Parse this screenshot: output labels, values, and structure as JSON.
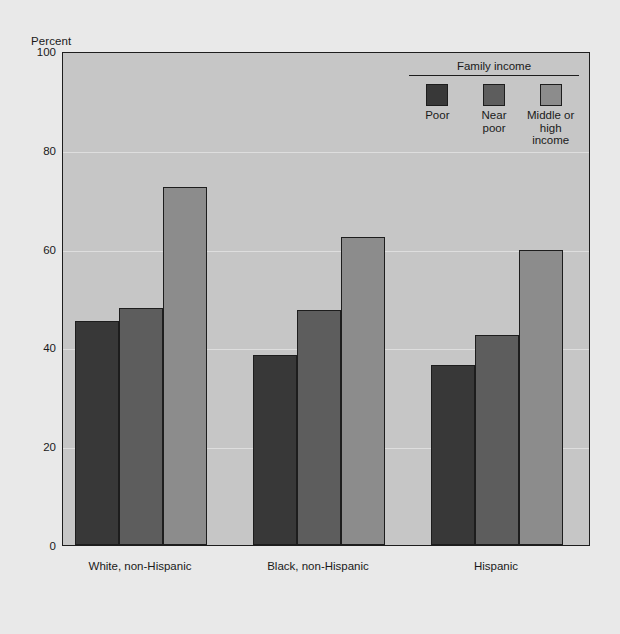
{
  "chart_data": {
    "type": "bar",
    "title": "",
    "xlabel": "",
    "ylabel": "Percent",
    "ylim": [
      0,
      100
    ],
    "yticks": [
      100,
      80,
      60,
      40,
      20,
      0
    ],
    "grid": true,
    "legend_position": "top-right",
    "legend_title": "Family income",
    "categories": [
      "White, non-Hispanic",
      "Black, non-Hispanic",
      "Hispanic"
    ],
    "series": [
      {
        "name": "Poor",
        "color": "#383838",
        "values": [
          45.3,
          38.4,
          36.5
        ]
      },
      {
        "name": "Near\npoor",
        "color": "#5d5d5d",
        "values": [
          48.0,
          47.5,
          42.6
        ]
      },
      {
        "name": "Middle or\nhigh income",
        "color": "#8c8c8c",
        "values": [
          72.5,
          62.4,
          59.8
        ]
      }
    ]
  },
  "axis": {
    "y_title": "Percent",
    "ticks": [
      "100",
      "80",
      "60",
      "40",
      "20",
      "0"
    ]
  },
  "legend": {
    "title": "Family income",
    "items": [
      {
        "label": "Poor",
        "color": "#383838"
      },
      {
        "label": "Near\npoor",
        "color": "#5d5d5d"
      },
      {
        "label": "Middle or\nhigh income",
        "color": "#8c8c8c"
      }
    ]
  },
  "groups": [
    {
      "label": "White, non-Hispanic"
    },
    {
      "label": "Black, non-Hispanic"
    },
    {
      "label": "Hispanic"
    }
  ],
  "colors": {
    "page_background": "#e9e9e9",
    "plot_background": "#c6c6c6",
    "frame": "#1d1d1d",
    "gridline": "#dedede"
  }
}
